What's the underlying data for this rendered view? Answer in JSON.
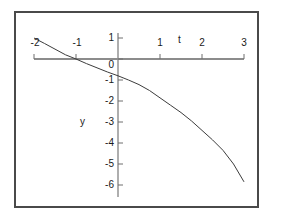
{
  "chart_data": {
    "type": "line",
    "title": "",
    "xlabel": "t",
    "ylabel": "y",
    "xlim": [
      -2,
      3
    ],
    "ylim": [
      -6.4,
      1.4
    ],
    "grid": false,
    "legend": null,
    "xticks": [
      -2,
      -1,
      1,
      2,
      3
    ],
    "xtick_labels": [
      "-2",
      "-1",
      "1",
      "2",
      "3"
    ],
    "yticks": [
      1,
      0,
      -1,
      -2,
      -3,
      -4,
      -5,
      -6
    ],
    "ytick_labels": [
      "1",
      "0",
      "-1",
      "-2",
      "-3",
      "-4",
      "-5",
      "-6"
    ],
    "series": [
      {
        "name": "curve",
        "style": "solid-thin",
        "color": "#3c3c3c",
        "x": [
          -2.0,
          -1.75,
          -1.5,
          -1.25,
          -1.0,
          -0.75,
          -0.5,
          -0.25,
          0.0,
          0.25,
          0.5,
          0.75,
          1.0,
          1.25,
          1.5,
          1.75,
          2.0,
          2.25,
          2.5,
          2.75,
          3.0
        ],
        "y": [
          1.0,
          0.74,
          0.47,
          0.2,
          0.0,
          -0.22,
          -0.42,
          -0.62,
          -0.8,
          -1.0,
          -1.22,
          -1.5,
          -1.85,
          -2.2,
          -2.55,
          -2.95,
          -3.4,
          -3.85,
          -4.35,
          -5.0,
          -5.85
        ]
      }
    ],
    "axis_color": "#8c8c8c",
    "frame_color": "#4a4a4a",
    "background": "#ffffff"
  },
  "labels": {
    "x_axis_name": "t",
    "y_axis_name": "y",
    "x_tick_0": "-2",
    "x_tick_1": "-1",
    "x_tick_2": "1",
    "x_tick_3": "2",
    "x_tick_4": "3",
    "y_tick_0": "1",
    "y_tick_1": "0",
    "y_tick_2": "-1",
    "y_tick_3": "-2",
    "y_tick_4": "-3",
    "y_tick_5": "-4",
    "y_tick_6": "-5",
    "y_tick_7": "-6"
  }
}
